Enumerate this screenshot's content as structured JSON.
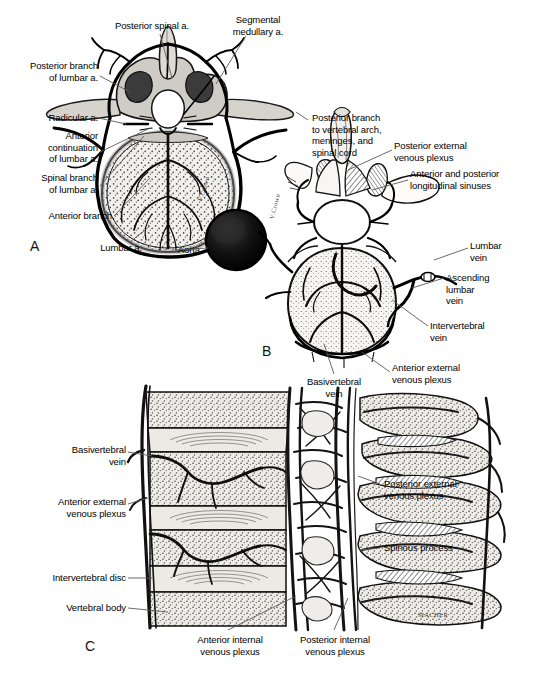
{
  "figure": {
    "background_color": "#ffffff",
    "ink_color": "#000000",
    "leader_color": "#555555"
  },
  "panels": [
    {
      "letter": "A",
      "name": "arterial-supply-lumbar-vertebra",
      "description": "Superior view of lumbar vertebra showing arterial supply and aorta"
    },
    {
      "letter": "B",
      "name": "venous-drainage-lumbar-vertebra",
      "description": "Oblique view of lumbar vertebra showing venous plexuses"
    },
    {
      "letter": "C",
      "name": "sagittal-section-vertebral-column",
      "description": "Sagittal section of vertebral column showing internal and external venous plexuses"
    }
  ],
  "labels_panel_a": [
    {
      "id": "posterior-spinal-a",
      "text": "Posterior spinal a.",
      "align": "center"
    },
    {
      "id": "segmental-medullary-a",
      "text": "Segmental\nmedullary a.",
      "align": "center"
    },
    {
      "id": "posterior-branch-of-lumbar-a",
      "text": "Posterior branch\nof lumbar a.",
      "align": "right"
    },
    {
      "id": "radicular-a",
      "text": "Radicular a.",
      "align": "right"
    },
    {
      "id": "anterior-continuation-of-lumbar-a",
      "text": "Anterior\ncontinuation\nof lumbar a.",
      "align": "right"
    },
    {
      "id": "spinal-branch-of-lumbar-a",
      "text": "Spinal branch\nof lumbar a.",
      "align": "right"
    },
    {
      "id": "anterior-branch",
      "text": "Anterior branch",
      "align": "right"
    },
    {
      "id": "lumbar-a",
      "text": "Lumbar a.",
      "align": "right"
    },
    {
      "id": "aorta",
      "text": "Aorta",
      "align": "right"
    }
  ],
  "labels_panel_b": [
    {
      "id": "posterior-branch-to-vertebral-arch",
      "text": "Posterior branch\nto vertebral arch,\nmeninges, and\nspinal cord",
      "align": "left"
    },
    {
      "id": "posterior-external-venous-plexus",
      "text": "Posterior external\nvenous plexus",
      "align": "left"
    },
    {
      "id": "anterior-and-posterior-longitudinal-sinuses",
      "text": "Anterior and posterior\nlongitudinal sinuses",
      "align": "left"
    },
    {
      "id": "lumbar-vein",
      "text": "Lumbar\nvein",
      "align": "left"
    },
    {
      "id": "ascending-lumbar-vein",
      "text": "Ascending\nlumbar\nvein",
      "align": "left"
    },
    {
      "id": "intervertebral-vein",
      "text": "Intervertebral\nvein",
      "align": "left"
    },
    {
      "id": "anterior-external-venous-plexus",
      "text": "Anterior external\nvenous plexus",
      "align": "left"
    },
    {
      "id": "basivertebral-vein",
      "text": "Basivertebral\nvein",
      "align": "center"
    }
  ],
  "labels_panel_c": [
    {
      "id": "basivertebral-vein-c",
      "text": "Basivertebral\nvein",
      "align": "right"
    },
    {
      "id": "anterior-external-venous-plexus-c",
      "text": "Anterior external\nvenous plexus",
      "align": "right"
    },
    {
      "id": "intervertebral-disc",
      "text": "Intervertebral disc",
      "align": "right"
    },
    {
      "id": "vertebral-body",
      "text": "Vertebral body",
      "align": "right"
    },
    {
      "id": "posterior-external-venous-plexus-c",
      "text": "Posterior external\nvenous plexus",
      "align": "left"
    },
    {
      "id": "spinous-process",
      "text": "Spinous process",
      "align": "left"
    },
    {
      "id": "anterior-internal-venous-plexus",
      "text": "Anterior internal\nvenous plexus",
      "align": "center"
    },
    {
      "id": "posterior-internal-venous-plexus",
      "text": "Posterior internal\nvenous plexus",
      "align": "center"
    }
  ],
  "signatures": [
    {
      "id": "signature-panel-a",
      "text": "V.Crown"
    },
    {
      "id": "signature-panel-b",
      "text": "V.Crown"
    },
    {
      "id": "signature-panel-c",
      "text": "MACHER"
    }
  ]
}
